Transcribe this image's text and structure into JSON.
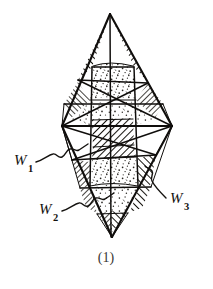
{
  "figure": {
    "caption": "(1)",
    "kind": "hand-drawn crystal bipyramid line drawing",
    "labels": [
      {
        "id": "w1",
        "base": "W",
        "sub": "1",
        "text": "W1",
        "x": 14,
        "y": 165,
        "sub_x": 28,
        "sub_y": 172
      },
      {
        "id": "w2",
        "base": "W",
        "sub": "2",
        "text": "W2",
        "x": 39,
        "y": 214,
        "sub_x": 53,
        "sub_y": 221
      },
      {
        "id": "w3",
        "base": "W",
        "sub": "3",
        "text": "W3",
        "x": 170,
        "y": 203,
        "sub_x": 184,
        "sub_y": 210
      }
    ],
    "caption_pos": {
      "x": 106,
      "y": 262
    },
    "geometry": {
      "top_apex": {
        "x": 110,
        "y": 14
      },
      "bottom_apex": {
        "x": 112,
        "y": 237
      },
      "left_vertex": {
        "x": 62,
        "y": 126
      },
      "right_vertex": {
        "x": 172,
        "y": 126
      },
      "upper_girdle_y": 67,
      "lower_girdle_y": 186,
      "core_left_x": 92,
      "core_right_x": 134
    },
    "colors": {
      "ink": "#100e0c",
      "paper": "#ffffff",
      "hatch": "#1a1815",
      "stipple": "#2a2723",
      "caption": "#3a3734"
    },
    "textures": [
      {
        "name": "diagonal-hatch-right",
        "angle": 45
      },
      {
        "name": "diagonal-hatch-left",
        "angle": -45
      },
      {
        "name": "stipple-dots",
        "angle": 0
      }
    ]
  }
}
